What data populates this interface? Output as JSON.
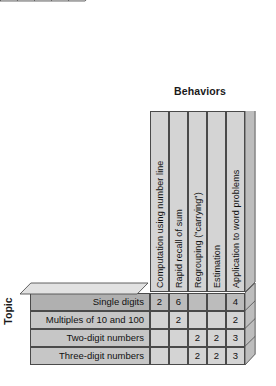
{
  "figure": {
    "type": "matrix-table",
    "column_axis_title": "Behaviors",
    "row_axis_title": "Topic",
    "columns": [
      {
        "label": "Computation using number line"
      },
      {
        "label": "Rapid recall of sum"
      },
      {
        "label": "Regrouping (\"carrying\")"
      },
      {
        "label": "Estimation"
      },
      {
        "label": "Application to word problems"
      }
    ],
    "rows": [
      {
        "label": "Single digits",
        "highlight": true,
        "values": [
          "2",
          "6",
          "",
          "",
          "4"
        ]
      },
      {
        "label": "Multiples of 10 and 100",
        "highlight": false,
        "values": [
          "",
          "2",
          "",
          "",
          "2"
        ]
      },
      {
        "label": "Two-digit numbers",
        "highlight": false,
        "values": [
          "",
          "",
          "2",
          "2",
          "3"
        ]
      },
      {
        "label": "Three-digit numbers",
        "highlight": false,
        "values": [
          "",
          "",
          "2",
          "2",
          "3"
        ]
      }
    ],
    "colors": {
      "cell_fill": "#d4d4d4",
      "row_label_fill": "#c6c6c6",
      "highlight_fill": "#b0b0b0",
      "top_face_fill": "#e2e2e2",
      "side_face_fill": "#bdbdbd",
      "outline": "#4a4a4a",
      "background": "#ffffff",
      "text": "#111111"
    }
  },
  "chart_data": {
    "type": "table",
    "title": "Behaviors",
    "xlabel": "Behaviors",
    "ylabel": "Topic",
    "categories": [
      "Computation using number line",
      "Rapid recall of sum",
      "Regrouping (\"carrying\")",
      "Estimation",
      "Application to word problems"
    ],
    "row_categories": [
      "Single digits",
      "Multiples of 10 and 100",
      "Two-digit numbers",
      "Three-digit numbers"
    ],
    "series": [
      {
        "name": "Single digits",
        "values": [
          2,
          6,
          null,
          null,
          4
        ]
      },
      {
        "name": "Multiples of 10 and 100",
        "values": [
          null,
          2,
          null,
          null,
          2
        ]
      },
      {
        "name": "Two-digit numbers",
        "values": [
          null,
          null,
          2,
          2,
          3
        ]
      },
      {
        "name": "Three-digit numbers",
        "values": [
          null,
          null,
          2,
          2,
          3
        ]
      }
    ],
    "grid": true,
    "legend": "none"
  }
}
